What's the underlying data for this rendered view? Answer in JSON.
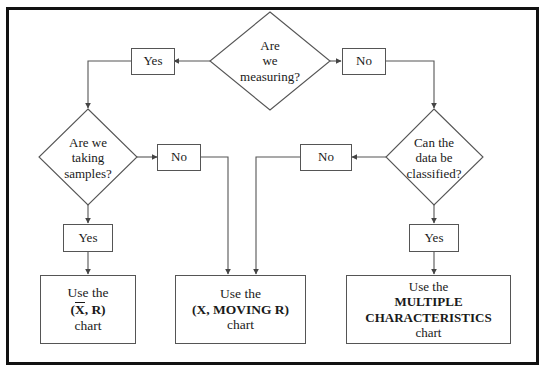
{
  "diagram": {
    "frame_color": "#111111",
    "line_color": "#555555",
    "text_color": "#1a1a1a",
    "background": "#ffffff",
    "decisions": [
      {
        "id": "measuring",
        "lines": [
          "Are",
          "we",
          "measuring?"
        ]
      },
      {
        "id": "taking-samples",
        "lines": [
          "Are we",
          "taking",
          "samples?"
        ]
      },
      {
        "id": "data-classified",
        "lines": [
          "Can the",
          "data be",
          "classified?"
        ]
      }
    ],
    "answers": {
      "measuring_yes": "Yes",
      "measuring_no": "No",
      "samples_no": "No",
      "samples_yes": "Yes",
      "classified_no": "No",
      "classified_yes": "Yes"
    },
    "results": [
      {
        "id": "xbar-r-chart",
        "line1": "Use the",
        "line2_prefix": "(",
        "line2_bar": "X",
        "line2_suffix": ", R)",
        "line3": "chart"
      },
      {
        "id": "x-moving-r-chart",
        "line1": "Use the",
        "line2": "(X, MOVING R)",
        "line3": "chart"
      },
      {
        "id": "multiple-characteristics-chart",
        "line1": "Use the",
        "line2": "MULTIPLE",
        "line3": "CHARACTERISTICS",
        "line4": "chart"
      }
    ]
  }
}
